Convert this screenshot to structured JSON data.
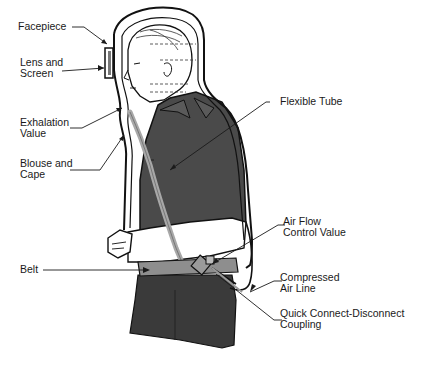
{
  "labels": {
    "facepiece": {
      "lines": [
        "Facepiece"
      ]
    },
    "lens_and_screen": {
      "lines": [
        "Lens and",
        "Screen"
      ]
    },
    "exhalation_value": {
      "lines": [
        "Exhalation",
        "Value"
      ]
    },
    "blouse_and_cape": {
      "lines": [
        "Blouse and",
        "Cape"
      ]
    },
    "belt": {
      "lines": [
        "Belt"
      ]
    },
    "flexible_tube": {
      "lines": [
        "Flexible Tube"
      ]
    },
    "air_flow_control_value": {
      "lines": [
        "Air Flow",
        "Control Value"
      ]
    },
    "compressed_air_line": {
      "lines": [
        "Compressed",
        "Air Line"
      ]
    },
    "quick_connect_coupling": {
      "lines": [
        "Quick Connect-Disconnect",
        "Coupling"
      ]
    }
  },
  "colors": {
    "ink": "#1a1a1a",
    "shirt": "#4a4a4a",
    "trousers": "#3a3a3a",
    "tube": "#a8a8a8",
    "belt": "#8e8e8e",
    "skin": "#ffffff"
  }
}
